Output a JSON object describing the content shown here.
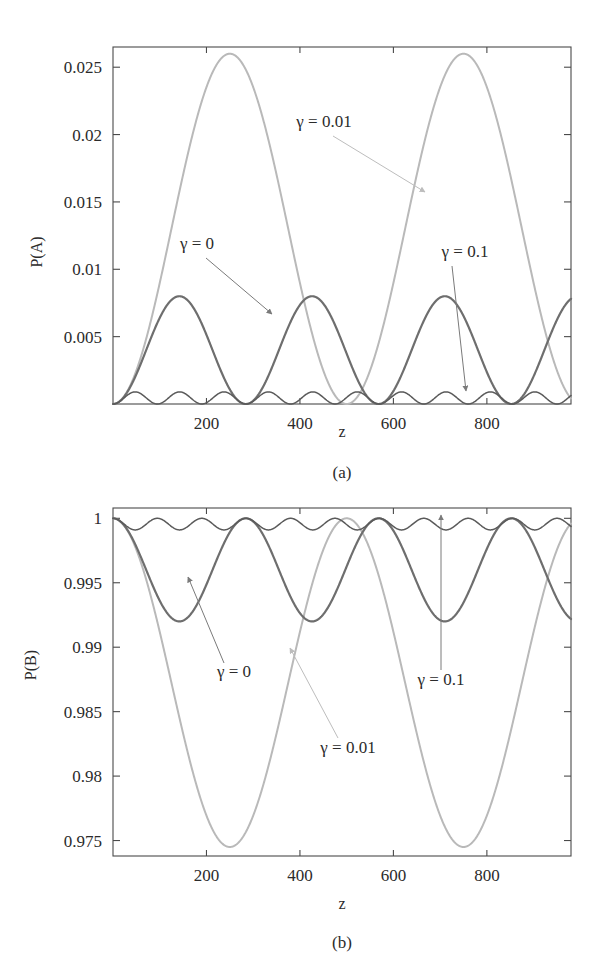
{
  "page": {
    "cut_off_caption_fragment": "· · · · · · · · · · · ·"
  },
  "figure": {
    "panel_a_tag": "(a)",
    "panel_b_tag": "(b)"
  },
  "colors": {
    "gamma_0": "#6e6e6e",
    "gamma_001": "#b9b9b9",
    "gamma_01": "#5a5a5a",
    "axis": "#4a4a4a",
    "text": "#2b2b2b",
    "arrow_dark": "#7a7a7a",
    "arrow_light": "#bdbdbd"
  },
  "chart_data": [
    {
      "type": "line",
      "id": "panel-a",
      "title": "",
      "xlabel": "z",
      "ylabel": "P(A)",
      "xlim": [
        0,
        980
      ],
      "ylim": [
        0,
        0.0265
      ],
      "grid": false,
      "legend": "inline-annotations",
      "xticks": [
        200,
        400,
        600,
        800
      ],
      "xticklabels": [
        "200",
        "400",
        "600",
        "800"
      ],
      "yticks": [
        0.005,
        0.01,
        0.015,
        0.02,
        0.025
      ],
      "yticklabels": [
        "0.005",
        "0.01",
        "0.015",
        "0.02",
        "0.025"
      ],
      "series": [
        {
          "name": "gamma_001",
          "label": "γ = 0.01",
          "color": "#b9b9b9",
          "amplitude": 0.026,
          "period": 500,
          "phase": 0,
          "baseline": 0,
          "description": "Large sin^2 oscillation, peaks 0.026 at z=250 and z=750, zeros at z=0,500,1000"
        },
        {
          "name": "gamma_0",
          "label": "γ = 0",
          "color": "#6e6e6e",
          "amplitude": 0.008,
          "period": 284,
          "phase": 0,
          "baseline": 0,
          "description": "Medium sin^2 oscillation, peaks ~0.008 at z=142, 426, 710, 994"
        },
        {
          "name": "gamma_01",
          "label": "γ = 0.1",
          "color": "#5a5a5a",
          "amplitude": 0.0009,
          "period": 95,
          "phase": 0,
          "baseline": 0,
          "description": "Small rapid sin^2 ripples hugging the zero axis"
        }
      ],
      "annotations": [
        {
          "text": "γ = 0.01",
          "color": "#bdbdbd",
          "points_to": "gamma_001 curve descending branch"
        },
        {
          "text": "γ = 0",
          "color": "#7a7a7a",
          "points_to": "gamma_0 curve second peak"
        },
        {
          "text": "γ = 0.1",
          "color": "#7a7a7a",
          "points_to": "gamma_01 ripples near zero"
        }
      ]
    },
    {
      "type": "line",
      "id": "panel-b",
      "title": "",
      "xlabel": "z",
      "ylabel": "P(B)",
      "xlim": [
        0,
        980
      ],
      "ylim": [
        0.9738,
        1.0008
      ],
      "grid": false,
      "legend": "inline-annotations",
      "xticks": [
        200,
        400,
        600,
        800
      ],
      "xticklabels": [
        "200",
        "400",
        "600",
        "800"
      ],
      "yticks": [
        0.975,
        0.98,
        0.985,
        0.99,
        0.995,
        1
      ],
      "yticklabels": [
        "0.975",
        "0.98",
        "0.985",
        "0.99",
        "0.995",
        "1"
      ],
      "series": [
        {
          "name": "gamma_001",
          "label": "γ = 0.01",
          "color": "#b9b9b9",
          "amplitude": 0.0255,
          "period": 500,
          "phase": 0,
          "baseline": 1,
          "description": "Large inverted sin^2, dips to 0.9745 at z=250 and z=750, returns to 1 at z=0,500,1000"
        },
        {
          "name": "gamma_0",
          "label": "γ = 0",
          "color": "#6e6e6e",
          "amplitude": 0.008,
          "period": 284,
          "phase": 0,
          "baseline": 1,
          "description": "Medium inverted sin^2, dips to ~0.992"
        },
        {
          "name": "gamma_01",
          "label": "γ = 0.1",
          "color": "#5a5a5a",
          "amplitude": 0.0009,
          "period": 95,
          "phase": 0,
          "baseline": 1,
          "description": "Small rapid inverted ripples hugging the line P(B)=1"
        }
      ],
      "annotations": [
        {
          "text": "γ = 0",
          "color": "#7a7a7a",
          "points_to": "gamma_0 curve local maximum"
        },
        {
          "text": "γ = 0.01",
          "color": "#bdbdbd",
          "points_to": "gamma_001 descending branch"
        },
        {
          "text": "γ = 0.1",
          "color": "#7a7a7a",
          "points_to": "gamma_01 ripples near one"
        }
      ]
    }
  ]
}
